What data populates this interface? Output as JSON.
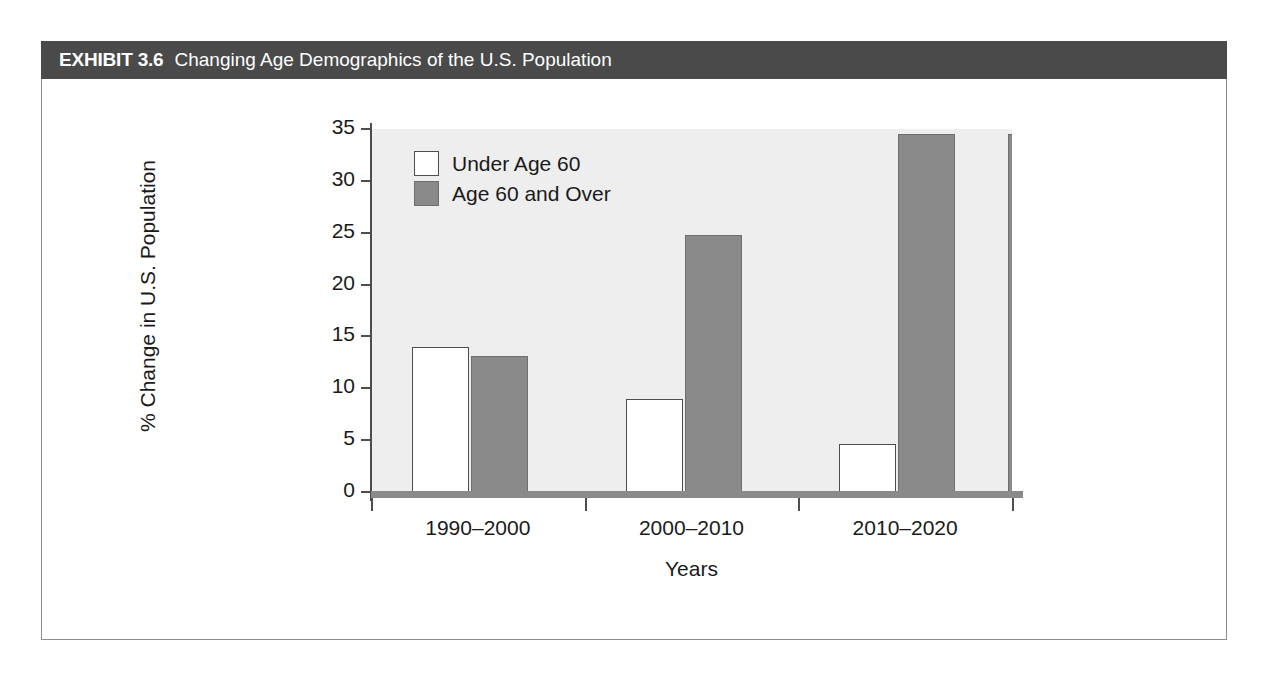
{
  "exhibit": {
    "number_label": "EXHIBIT 3.6",
    "title": "Changing Age Demographics of the U.S. Population"
  },
  "colors": {
    "header_band": "#4a4a4a",
    "plot_background": "#eeeeee",
    "under_60_bar": "#ffffff",
    "over_60_bar": "#8a8a8a",
    "axis": "#4d4d4d",
    "text": "#1a1a1a"
  },
  "chart_data": {
    "type": "bar",
    "title": "Changing Age Demographics of the U.S. Population",
    "xlabel": "Years",
    "ylabel": "% Change in U.S. Population",
    "categories": [
      "1990–2000",
      "2000–2010",
      "2010–2020"
    ],
    "series": [
      {
        "name": "Under Age 60",
        "values": [
          14.0,
          9.0,
          4.6
        ],
        "color": "#ffffff"
      },
      {
        "name": "Age 60 and Over",
        "values": [
          13.1,
          24.8,
          34.5
        ],
        "color": "#8a8a8a"
      }
    ],
    "ylim": [
      0,
      35
    ],
    "yticks": [
      0,
      5,
      10,
      15,
      20,
      25,
      30,
      35
    ],
    "ytick_labels": [
      "0",
      "5",
      "10",
      "15",
      "20",
      "25",
      "30",
      "35"
    ],
    "grid": false,
    "legend_position": "upper-left-inside"
  }
}
